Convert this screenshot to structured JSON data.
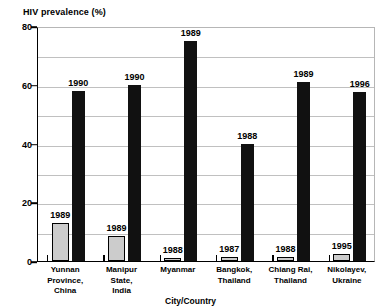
{
  "chart_data": {
    "type": "bar",
    "title": "HIV prevalence (%)",
    "xlabel": "City/Country",
    "ylabel": "HIV prevalence (%)",
    "ylim": [
      0,
      80
    ],
    "yticks": [
      0,
      20,
      40,
      60,
      80
    ],
    "ytick_labels": [
      "0",
      "20",
      "40",
      "60",
      "80"
    ],
    "minor_gridlines": [
      10,
      30,
      50,
      70
    ],
    "grid": true,
    "legend": "none",
    "categories": [
      "Yunnan Province, China",
      "Manipur State, India",
      "Myanmar",
      "Bangkok, Thailand",
      "Chiang Rai, Thailand",
      "Nikolayev, Ukraine"
    ],
    "category_lines": [
      [
        "Yunnan",
        "Province,",
        "China"
      ],
      [
        "Manipur",
        "State,",
        "India"
      ],
      [
        "Myanmar"
      ],
      [
        "Bangkok,",
        "Thailand"
      ],
      [
        "Chiang Rai,",
        "Thailand"
      ],
      [
        "Nikolayev,",
        "Ukraine"
      ]
    ],
    "series": [
      {
        "name": "Earlier year prevalence",
        "color": "#cccccc",
        "values": [
          13,
          8.5,
          0.8,
          1.2,
          1.2,
          2.5
        ],
        "point_labels": [
          "1989",
          "1989",
          "1988",
          "1987",
          "1988",
          "1995"
        ]
      },
      {
        "name": "Later year prevalence",
        "color": "#111111",
        "values": [
          58,
          60,
          75,
          40,
          61,
          57.5
        ],
        "point_labels": [
          "1990",
          "1990",
          "1989",
          "1988",
          "1989",
          "1996"
        ]
      }
    ]
  }
}
